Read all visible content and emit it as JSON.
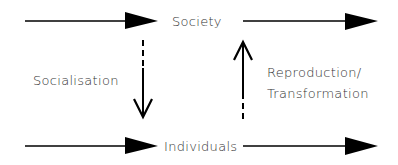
{
  "diagram": {
    "nodes": {
      "top": "Society",
      "bottom": "Individuals"
    },
    "edges": {
      "down_label": "Socialisation",
      "up_label_line1": "Reproduction/",
      "up_label_line2": "Transformation"
    },
    "colors": {
      "stroke": "#000000",
      "text": "#333333",
      "background": "#ffffff"
    }
  }
}
